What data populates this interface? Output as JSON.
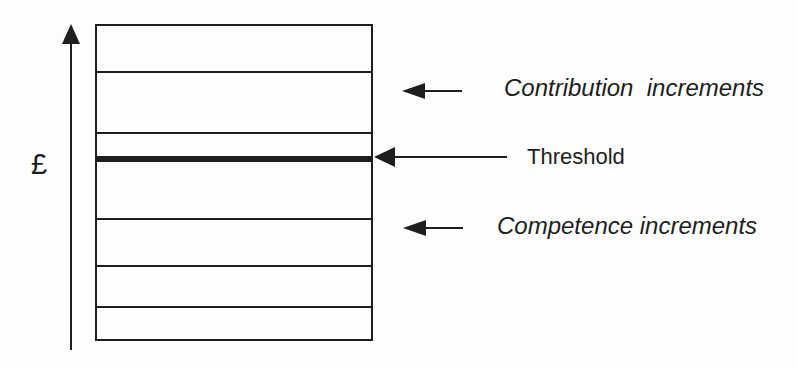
{
  "figure": {
    "axis": {
      "label": "£"
    },
    "callouts": {
      "contribution": {
        "label": "Contribution  increments"
      },
      "threshold": {
        "label": "Threshold"
      },
      "competence": {
        "label": "Competence increments"
      }
    },
    "ladder": {
      "divider_offsets_px": [
        45,
        106,
        192,
        239,
        280
      ],
      "threshold_offset_px": 130,
      "threshold_thickness_px": 6,
      "segments_total": 7,
      "segments_above_threshold": 3,
      "segments_below_threshold": 4
    },
    "colors": {
      "ink": "#1e1e1e",
      "background": "#fdfdfd"
    }
  }
}
